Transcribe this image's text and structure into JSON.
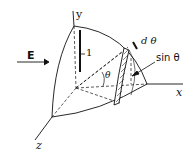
{
  "figure": {
    "labels": {
      "y_axis": "y",
      "x_axis": "x",
      "z_axis": "z",
      "field": "E",
      "radius": "1",
      "angle": "θ",
      "d_theta": "d θ",
      "sin_theta": "sin θ"
    },
    "colors": {
      "line": "#111111",
      "background": "#ffffff"
    }
  }
}
